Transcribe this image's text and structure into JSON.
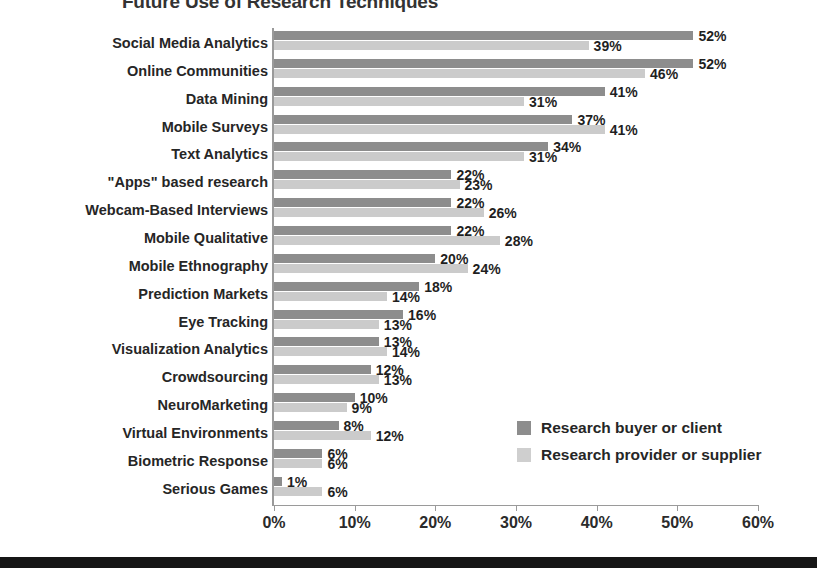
{
  "chart_data": {
    "type": "bar",
    "orientation": "horizontal",
    "title": "Future Use of Research Techniques",
    "xlabel": "",
    "ylabel": "",
    "xlim": [
      0,
      60
    ],
    "xticks": [
      "0%",
      "10%",
      "20%",
      "30%",
      "40%",
      "50%",
      "60%"
    ],
    "xtick_values": [
      0,
      10,
      20,
      30,
      40,
      50,
      60
    ],
    "grid": false,
    "legend_position": "inside-lower-right",
    "value_suffix": "%",
    "categories": [
      "Social Media Analytics",
      "Online Communities",
      "Data Mining",
      "Mobile Surveys",
      "Text Analytics",
      "\"Apps\" based research",
      "Webcam-Based Interviews",
      "Mobile Qualitative",
      "Mobile Ethnography",
      "Prediction Markets",
      "Eye Tracking",
      "Visualization Analytics",
      "Crowdsourcing",
      "NeuroMarketing",
      "Virtual Environments",
      "Biometric Response",
      "Serious Games"
    ],
    "series": [
      {
        "name": "Research buyer or client",
        "color": "#8d8d8d",
        "values": [
          52,
          52,
          41,
          37,
          34,
          22,
          22,
          22,
          20,
          18,
          16,
          13,
          12,
          10,
          8,
          6,
          1
        ],
        "labels": [
          "52%",
          "52%",
          "41%",
          "37%",
          "34%",
          "22%",
          "22%",
          "22%",
          "20%",
          "18%",
          "16%",
          "13%",
          "12%",
          "10%",
          "8%",
          "6%",
          "1%"
        ]
      },
      {
        "name": "Research provider or supplier",
        "color": "#cbcbcb",
        "values": [
          39,
          46,
          31,
          41,
          31,
          23,
          26,
          28,
          24,
          14,
          13,
          14,
          13,
          9,
          12,
          6,
          6
        ],
        "labels": [
          "39%",
          "46%",
          "31%",
          "41%",
          "31%",
          "23%",
          "26%",
          "28%",
          "24%",
          "14%",
          "13%",
          "14%",
          "13%",
          "9%",
          "12%",
          "6%",
          "6%"
        ]
      }
    ]
  }
}
